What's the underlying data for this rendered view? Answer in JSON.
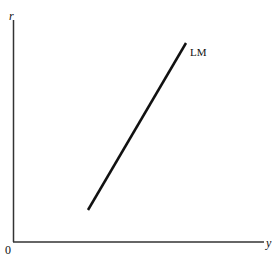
{
  "diagram": {
    "title": "",
    "axes": {
      "y_label": "r",
      "x_label": "y",
      "origin_label": "0"
    },
    "curves": [
      {
        "name": "LM",
        "label": "LM",
        "type": "line",
        "from": [
          88,
          210
        ],
        "to": [
          186,
          43
        ]
      }
    ],
    "colors": {
      "line": "#111111",
      "axis": "#333333",
      "background": "#ffffff"
    }
  }
}
